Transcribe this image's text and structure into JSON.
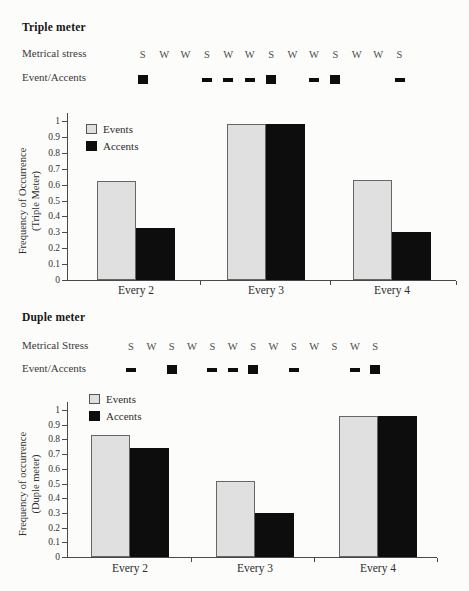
{
  "sections": [
    {
      "heading": "Triple meter",
      "stress_label": "Metrical stress",
      "accents_label": "Event/Accents",
      "pattern": [
        {
          "stress": "S",
          "marker": "square"
        },
        {
          "stress": "W",
          "marker": "none"
        },
        {
          "stress": "W",
          "marker": "none"
        },
        {
          "stress": "S",
          "marker": "dash"
        },
        {
          "stress": "W",
          "marker": "dash"
        },
        {
          "stress": "W",
          "marker": "dash"
        },
        {
          "stress": "S",
          "marker": "square"
        },
        {
          "stress": "W",
          "marker": "none"
        },
        {
          "stress": "W",
          "marker": "dash"
        },
        {
          "stress": "S",
          "marker": "square"
        },
        {
          "stress": "W",
          "marker": "none"
        },
        {
          "stress": "W",
          "marker": "none"
        },
        {
          "stress": "S",
          "marker": "dash"
        }
      ]
    },
    {
      "heading": "Duple meter",
      "stress_label": "Metrical Stress",
      "accents_label": "Event/Accents",
      "pattern": [
        {
          "stress": "S",
          "marker": "dash"
        },
        {
          "stress": "W",
          "marker": "none"
        },
        {
          "stress": "S",
          "marker": "square"
        },
        {
          "stress": "W",
          "marker": "none"
        },
        {
          "stress": "S",
          "marker": "dash"
        },
        {
          "stress": "W",
          "marker": "dash"
        },
        {
          "stress": "S",
          "marker": "square"
        },
        {
          "stress": "W",
          "marker": "none"
        },
        {
          "stress": "S",
          "marker": "dash"
        },
        {
          "stress": "W",
          "marker": "none"
        },
        {
          "stress": "S",
          "marker": "none"
        },
        {
          "stress": "W",
          "marker": "dash"
        },
        {
          "stress": "S",
          "marker": "square"
        }
      ]
    }
  ],
  "chart_data": [
    {
      "type": "bar",
      "categories": [
        "Every 2",
        "Every 3",
        "Every 4"
      ],
      "series": [
        {
          "name": "Events",
          "values": [
            0.62,
            0.98,
            0.63
          ]
        },
        {
          "name": "Accents",
          "values": [
            0.33,
            0.98,
            0.3
          ]
        }
      ],
      "title": "",
      "xlabel": "",
      "ylabel": "Frequency of Occurrence (Triple Meter)",
      "ylabel_lines": [
        "Frequency of Occurrence",
        "(Triple Meter)"
      ],
      "ylim": [
        0,
        1
      ],
      "ytick_step": 0.1,
      "yticks": [
        "1",
        "0.9",
        "0.8",
        "0.7",
        "0.6",
        "0.5",
        "0.4",
        "0.3",
        "0.2",
        "0.1",
        "0"
      ],
      "legend_entries": [
        "Events",
        "Accents"
      ],
      "legend_position": "top-left-inside",
      "grid": false
    },
    {
      "type": "bar",
      "categories": [
        "Every 2",
        "Every 3",
        "Every 4"
      ],
      "series": [
        {
          "name": "Events",
          "values": [
            0.83,
            0.52,
            0.96
          ]
        },
        {
          "name": "Accents",
          "values": [
            0.74,
            0.3,
            0.96
          ]
        }
      ],
      "title": "",
      "xlabel": "",
      "ylabel": "Frequency of occurrence (Duple meter)",
      "ylabel_lines": [
        "Frequency of occurrence",
        "(Duple meter)"
      ],
      "ylim": [
        0,
        1
      ],
      "ytick_step": 0.1,
      "yticks": [
        "1",
        "0.9",
        "0.8",
        "0.7",
        "0.6",
        "0.5",
        "0.4",
        "0.3",
        "0.2",
        "0.1",
        "0"
      ],
      "legend_entries": [
        "Events",
        "Accents"
      ],
      "legend_position": "top-left-above",
      "grid": false
    }
  ],
  "colors": {
    "events_fill": "#e0e0e0",
    "events_border": "#666666",
    "accents_fill": "#0d0d0d",
    "axis": "#4a4a4a"
  }
}
